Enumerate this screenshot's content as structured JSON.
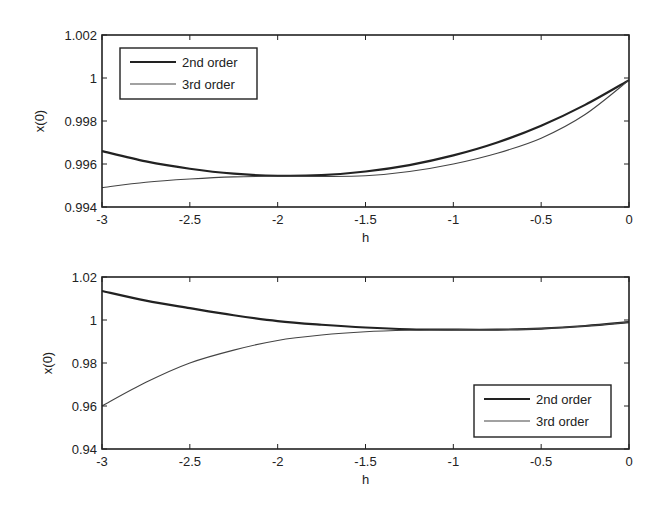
{
  "chart_data": [
    {
      "type": "line",
      "title": "",
      "xlabel": "h",
      "ylabel": "x(0)",
      "xlim": [
        -3,
        0
      ],
      "ylim": [
        0.994,
        1.002
      ],
      "xticks": [
        -3,
        -2.5,
        -2,
        -1.5,
        -1,
        -0.5,
        0
      ],
      "xtick_labels": [
        "-3",
        "-2.5",
        "-2",
        "-1.5",
        "-1",
        "-0.5",
        "0"
      ],
      "yticks": [
        0.994,
        0.996,
        0.998,
        1.0,
        1.002
      ],
      "ytick_labels": [
        "0.994",
        "0.996",
        "0.998",
        "1",
        "1.002"
      ],
      "grid": false,
      "legend_position": "upper left",
      "x": [
        -3,
        -2.75,
        -2.5,
        -2.25,
        -2,
        -1.75,
        -1.5,
        -1.25,
        -1,
        -0.75,
        -0.5,
        -0.25,
        0
      ],
      "series": [
        {
          "name": "2nd order",
          "color": "#222222",
          "width": 2.2,
          "values": [
            0.9966,
            0.99612,
            0.99578,
            0.99555,
            0.99545,
            0.99548,
            0.99565,
            0.99595,
            0.9964,
            0.997,
            0.99778,
            0.99875,
            0.9999
          ]
        },
        {
          "name": "3rd order",
          "color": "#444444",
          "width": 1.1,
          "values": [
            0.9949,
            0.99515,
            0.9953,
            0.9954,
            0.99543,
            0.99542,
            0.99545,
            0.99565,
            0.996,
            0.9965,
            0.9972,
            0.9983,
            0.9999
          ]
        }
      ]
    },
    {
      "type": "line",
      "title": "",
      "xlabel": "h",
      "ylabel": "x(0)",
      "xlim": [
        -3,
        0
      ],
      "ylim": [
        0.94,
        1.02
      ],
      "xticks": [
        -3,
        -2.5,
        -2,
        -1.5,
        -1,
        -0.5,
        0
      ],
      "xtick_labels": [
        "-3",
        "-2.5",
        "-2",
        "-1.5",
        "-1",
        "-0.5",
        "0"
      ],
      "yticks": [
        0.94,
        0.96,
        0.98,
        1.0,
        1.02
      ],
      "ytick_labels": [
        "0.94",
        "0.96",
        "0.98",
        "1",
        "1.02"
      ],
      "grid": false,
      "legend_position": "lower right",
      "x": [
        -3,
        -2.75,
        -2.5,
        -2.25,
        -2,
        -1.75,
        -1.5,
        -1.25,
        -1,
        -0.75,
        -0.5,
        -0.25,
        0
      ],
      "series": [
        {
          "name": "2nd order",
          "color": "#222222",
          "width": 2.2,
          "values": [
            1.0135,
            1.009,
            1.0055,
            1.0022,
            0.9995,
            0.9978,
            0.9965,
            0.9957,
            0.9955,
            0.9955,
            0.996,
            0.9972,
            0.999
          ]
        },
        {
          "name": "3rd order",
          "color": "#444444",
          "width": 1.1,
          "values": [
            0.96,
            0.971,
            0.98,
            0.986,
            0.9905,
            0.993,
            0.9945,
            0.9952,
            0.9955,
            0.9955,
            0.996,
            0.9972,
            0.999
          ]
        }
      ]
    }
  ]
}
